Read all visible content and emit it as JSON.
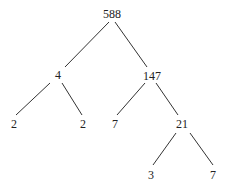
{
  "diagram": {
    "type": "factor-tree",
    "nodes": {
      "root": "588",
      "left": "4",
      "right": "147",
      "left_left": "2",
      "left_right": "2",
      "right_left": "7",
      "right_right": "21",
      "rr_left": "3",
      "rr_right": "7"
    },
    "edges": [
      [
        "588",
        "4"
      ],
      [
        "588",
        "147"
      ],
      [
        "4",
        "2"
      ],
      [
        "4",
        "2"
      ],
      [
        "147",
        "7"
      ],
      [
        "147",
        "21"
      ],
      [
        "21",
        "3"
      ],
      [
        "21",
        "7"
      ]
    ]
  }
}
